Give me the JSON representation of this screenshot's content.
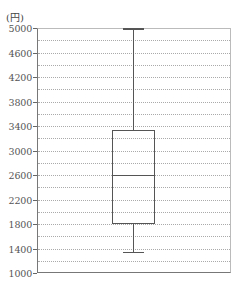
{
  "header": {
    "fragment_text": "",
    "unit_label": "(円)"
  },
  "chart_data": {
    "type": "boxplot",
    "title": "",
    "xlabel": "",
    "ylabel": "(円)",
    "ylim": [
      1000,
      5000
    ],
    "yticks": [
      5000,
      4600,
      4200,
      3800,
      3400,
      3000,
      2600,
      2200,
      1800,
      1400,
      1000
    ],
    "ytick_labels": [
      "5000",
      "4600",
      "4200",
      "3800",
      "3400",
      "3000",
      "2600",
      "2200",
      "1800",
      "1400",
      "1000"
    ],
    "grid": {
      "on": true,
      "style": "dotted",
      "interval": 200
    },
    "series": [
      {
        "name": "",
        "min": 1340,
        "q1": 1820,
        "median": 2600,
        "q3": 3340,
        "max": 5000
      }
    ],
    "legend": null
  }
}
